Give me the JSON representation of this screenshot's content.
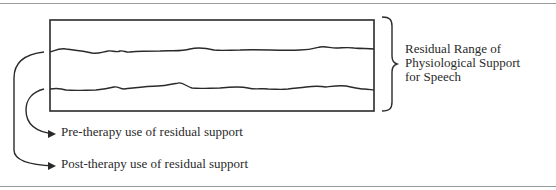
{
  "diagram": {
    "range_label": {
      "lines": [
        "Residual Range of",
        "Physiological Support",
        "for Speech"
      ]
    },
    "arrows": [
      {
        "label": "Pre-therapy use of residual support",
        "source": "lower-wavy-line"
      },
      {
        "label": "Post-therapy use of residual support",
        "source": "upper-wavy-line"
      }
    ],
    "colors": {
      "line": "#2a2a2a",
      "rule": "#9a9a9a",
      "background": "#ffffff"
    }
  }
}
